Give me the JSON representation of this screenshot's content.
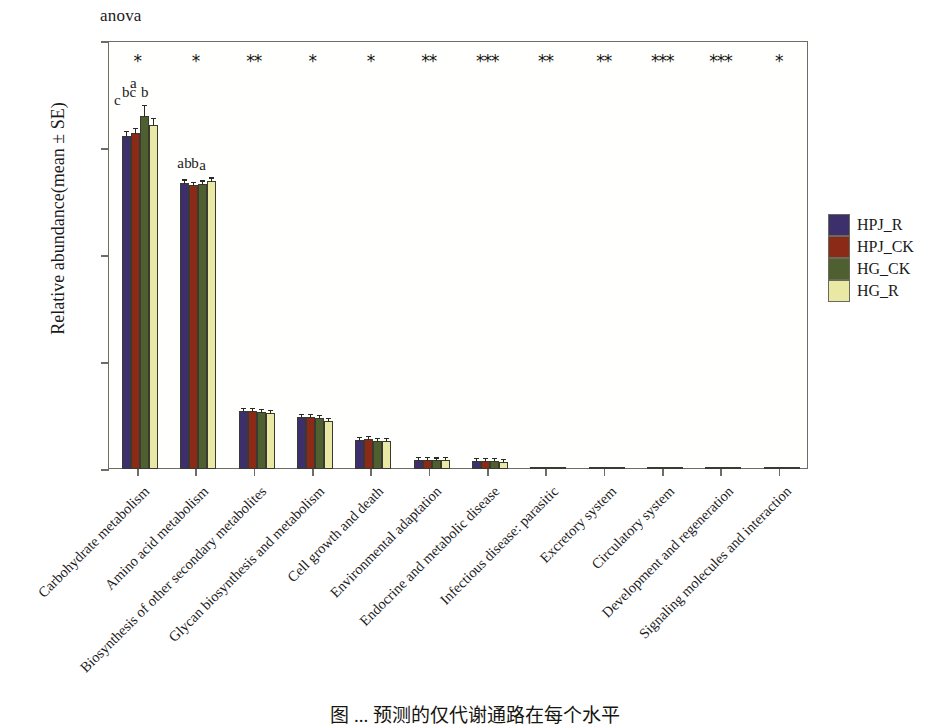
{
  "figure": {
    "anova_label": "anova",
    "caption": "图 ... 预测的仅代谢通路在每个水平"
  },
  "chart_data": {
    "type": "bar",
    "title": "",
    "subtitle": "anova",
    "xlabel": "",
    "ylabel": "Relative abundance(mean ± SE)",
    "ylim": [
      0.0,
      0.2
    ],
    "yticks": [
      "0.00",
      "0.05",
      "0.10",
      "0.15",
      "0.20"
    ],
    "ytick_values": [
      0.0,
      0.05,
      0.1,
      0.15,
      0.2
    ],
    "grid": false,
    "legend_position": "right",
    "categories": [
      "Carbohydrate metabolism",
      "Amino acid metabolism",
      "Biosynthesis of other secondary metabolites",
      "Glycan biosynthesis and metabolism",
      "Cell growth and death",
      "Environmental adaptation",
      "Endocrine and metabolic disease",
      "Infectious disease: parasitic",
      "Excretory system",
      "Circulatory system",
      "Development and regeneration",
      "Signaling molecules and interaction"
    ],
    "series": [
      {
        "name": "HPJ_R",
        "color": "#3c2f6b",
        "values": [
          0.1555,
          0.1337,
          0.0272,
          0.0243,
          0.0137,
          0.0042,
          0.0038,
          0.0008,
          0.0003,
          0.0002,
          0.0002,
          0.0001
        ],
        "errors": [
          0.0012,
          0.0008,
          0.0006,
          0.0005,
          0.0004,
          0.0003,
          0.0003,
          0.0002,
          0.0001,
          0.0001,
          0.0001,
          0.0001
        ]
      },
      {
        "name": "HPJ_CK",
        "color": "#8c2a18",
        "values": [
          0.1572,
          0.1325,
          0.027,
          0.0242,
          0.0139,
          0.0041,
          0.0037,
          0.0008,
          0.0003,
          0.0002,
          0.0002,
          0.0001
        ],
        "errors": [
          0.0011,
          0.0008,
          0.0006,
          0.0005,
          0.0004,
          0.0003,
          0.0003,
          0.0002,
          0.0001,
          0.0001,
          0.0001,
          0.0001
        ]
      },
      {
        "name": "HG_CK",
        "color": "#4f6030",
        "values": [
          0.1648,
          0.1331,
          0.0268,
          0.0238,
          0.0131,
          0.004,
          0.0036,
          0.0008,
          0.0003,
          0.0002,
          0.0002,
          0.0001
        ],
        "errors": [
          0.0026,
          0.0009,
          0.0006,
          0.0005,
          0.0004,
          0.0003,
          0.0003,
          0.0002,
          0.0001,
          0.0001,
          0.0001,
          0.0001
        ]
      },
      {
        "name": "HG_R",
        "color": "#e9e9a5",
        "values": [
          0.1609,
          0.1345,
          0.0264,
          0.0226,
          0.0133,
          0.0043,
          0.0035,
          0.0008,
          0.0003,
          0.0002,
          0.0002,
          0.0001
        ],
        "errors": [
          0.0015,
          0.0009,
          0.0006,
          0.0005,
          0.0004,
          0.0003,
          0.0003,
          0.0002,
          0.0001,
          0.0001,
          0.0001,
          0.0001
        ]
      }
    ],
    "significance_stars": [
      "*",
      "*",
      "**",
      "*",
      "*",
      "**",
      "***",
      "**",
      "**",
      "***",
      "***",
      "*"
    ],
    "group_letters": [
      [
        "c",
        "bc",
        "a",
        "b"
      ],
      [
        "a",
        "b",
        "b",
        "a"
      ],
      [],
      [],
      [],
      [],
      [],
      [],
      [],
      [],
      [],
      []
    ]
  },
  "legend": {
    "items": [
      {
        "label": "HPJ_R",
        "color": "#3c2f6b"
      },
      {
        "label": "HPJ_CK",
        "color": "#8c2a18"
      },
      {
        "label": "HG_CK",
        "color": "#4f6030"
      },
      {
        "label": "HG_R",
        "color": "#e9e9a5"
      }
    ]
  }
}
